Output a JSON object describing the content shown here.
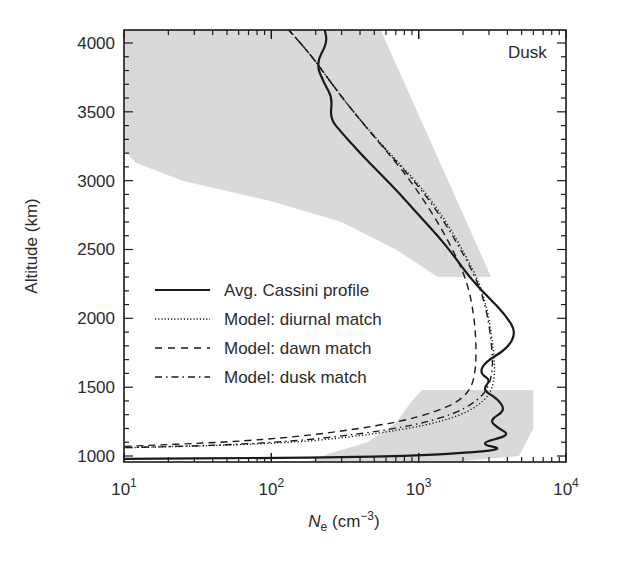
{
  "chart_data": {
    "type": "line",
    "title": "",
    "annotation": "Dusk",
    "xlabel": "N_e (cm^-3)",
    "xlabel_main": "N",
    "xlabel_sub": "e",
    "xlabel_unit_pre": " (cm",
    "xlabel_unit_sup": "−3",
    "xlabel_unit_post": ")",
    "ylabel": "Altitude (km)",
    "xscale": "log",
    "xlim": [
      10,
      10000
    ],
    "ylim": [
      960,
      4100
    ],
    "grid": false,
    "legend_position": "center-left",
    "x_ticks": [
      {
        "value": 10,
        "base": "10",
        "exp": "1"
      },
      {
        "value": 100,
        "base": "10",
        "exp": "2"
      },
      {
        "value": 1000,
        "base": "10",
        "exp": "3"
      },
      {
        "value": 10000,
        "base": "10",
        "exp": "4"
      }
    ],
    "y_ticks": [
      1000,
      1500,
      2000,
      2500,
      3000,
      3500,
      4000
    ],
    "series": [
      {
        "name": "Avg. Cassini profile",
        "style": "solid",
        "points": [
          [
            230,
            4100
          ],
          [
            240,
            4000
          ],
          [
            200,
            3850
          ],
          [
            230,
            3700
          ],
          [
            260,
            3600
          ],
          [
            250,
            3450
          ],
          [
            300,
            3350
          ],
          [
            400,
            3200
          ],
          [
            550,
            3050
          ],
          [
            750,
            2900
          ],
          [
            1000,
            2750
          ],
          [
            1350,
            2600
          ],
          [
            1750,
            2450
          ],
          [
            2200,
            2300
          ],
          [
            3000,
            2150
          ],
          [
            3900,
            2020
          ],
          [
            4600,
            1900
          ],
          [
            4000,
            1780
          ],
          [
            2800,
            1680
          ],
          [
            2600,
            1600
          ],
          [
            3100,
            1550
          ],
          [
            2700,
            1480
          ],
          [
            3400,
            1420
          ],
          [
            3900,
            1330
          ],
          [
            3000,
            1260
          ],
          [
            3500,
            1200
          ],
          [
            4200,
            1150
          ],
          [
            2500,
            1090
          ],
          [
            3900,
            1050
          ],
          [
            2000,
            1020
          ],
          [
            800,
            1000
          ],
          [
            300,
            990
          ],
          [
            100,
            985
          ],
          [
            10,
            980
          ]
        ]
      },
      {
        "name": "Model: diurnal match",
        "style": "dotted",
        "points": [
          [
            130,
            4100
          ],
          [
            190,
            3900
          ],
          [
            280,
            3650
          ],
          [
            430,
            3400
          ],
          [
            700,
            3150
          ],
          [
            1050,
            2950
          ],
          [
            1550,
            2700
          ],
          [
            2100,
            2450
          ],
          [
            2600,
            2250
          ],
          [
            2950,
            2050
          ],
          [
            3150,
            1850
          ],
          [
            3300,
            1650
          ],
          [
            3200,
            1500
          ],
          [
            2800,
            1400
          ],
          [
            2000,
            1300
          ],
          [
            1100,
            1220
          ],
          [
            500,
            1160
          ],
          [
            200,
            1110
          ],
          [
            60,
            1080
          ],
          [
            10,
            1060
          ]
        ]
      },
      {
        "name": "Model: dawn match",
        "style": "dashed",
        "points": [
          [
            130,
            4100
          ],
          [
            190,
            3900
          ],
          [
            280,
            3650
          ],
          [
            430,
            3400
          ],
          [
            680,
            3150
          ],
          [
            950,
            2950
          ],
          [
            1350,
            2700
          ],
          [
            1800,
            2450
          ],
          [
            2150,
            2250
          ],
          [
            2350,
            2050
          ],
          [
            2450,
            1850
          ],
          [
            2450,
            1650
          ],
          [
            2300,
            1500
          ],
          [
            1900,
            1400
          ],
          [
            1300,
            1320
          ],
          [
            750,
            1250
          ],
          [
            350,
            1190
          ],
          [
            150,
            1140
          ],
          [
            50,
            1100
          ],
          [
            10,
            1070
          ]
        ]
      },
      {
        "name": "Model: dusk match",
        "style": "dash-dot",
        "points": [
          [
            130,
            4100
          ],
          [
            190,
            3900
          ],
          [
            280,
            3650
          ],
          [
            430,
            3400
          ],
          [
            690,
            3150
          ],
          [
            1020,
            2950
          ],
          [
            1500,
            2700
          ],
          [
            2050,
            2450
          ],
          [
            2550,
            2250
          ],
          [
            2900,
            2050
          ],
          [
            3100,
            1850
          ],
          [
            3200,
            1650
          ],
          [
            3000,
            1500
          ],
          [
            2500,
            1400
          ],
          [
            1700,
            1300
          ],
          [
            900,
            1220
          ],
          [
            400,
            1160
          ],
          [
            150,
            1110
          ],
          [
            50,
            1080
          ],
          [
            10,
            1060
          ]
        ]
      }
    ],
    "shaded_regions": [
      {
        "name": "upper-variability-band",
        "color": "#d9d9d9",
        "polygon": [
          [
            10,
            4100
          ],
          [
            550,
            4100
          ],
          [
            3100,
            2300
          ],
          [
            1350,
            2300
          ],
          [
            700,
            2500
          ],
          [
            300,
            2700
          ],
          [
            100,
            2850
          ],
          [
            25,
            3000
          ],
          [
            12,
            3130
          ],
          [
            10,
            3220
          ]
        ]
      },
      {
        "name": "lower-variability-band",
        "color": "#d9d9d9",
        "polygon": [
          [
            1050,
            1480
          ],
          [
            6000,
            1480
          ],
          [
            6000,
            1200
          ],
          [
            4800,
            1000
          ],
          [
            1800,
            960
          ],
          [
            180,
            960
          ],
          [
            250,
            1020
          ],
          [
            450,
            1100
          ],
          [
            700,
            1240
          ],
          [
            900,
            1400
          ]
        ]
      }
    ]
  },
  "colors": {
    "background": "#ffffff",
    "shade": "#d9d9d9",
    "line": "#1a1a1a",
    "text": "#2b2b2b"
  }
}
